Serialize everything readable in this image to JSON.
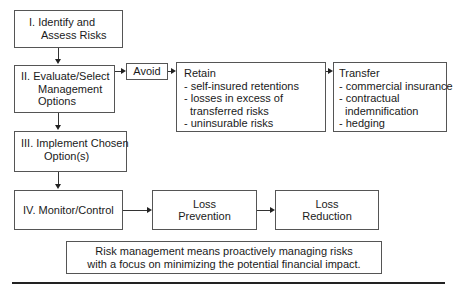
{
  "steps": [
    {
      "id": "identify",
      "lines": [
        "I.  Identify and",
        "Assess Risks"
      ]
    },
    {
      "id": "evaluate",
      "lines": [
        "II.  Evaluate/Select",
        "Management",
        "Options"
      ]
    },
    {
      "id": "implement",
      "lines": [
        "III.  Implement Chosen",
        "Option(s)"
      ]
    },
    {
      "id": "monitor",
      "lines": [
        "IV.  Monitor/Control"
      ]
    }
  ],
  "options": {
    "avoid": {
      "title": "Avoid"
    },
    "retain": {
      "title": "Retain",
      "items": [
        "- self-insured retentions",
        "- losses in excess of",
        "transferred risks",
        "- uninsurable risks"
      ]
    },
    "transfer": {
      "title": "Transfer",
      "items": [
        "- commercial insurance",
        "- contractual",
        "indemnification",
        "- hedging"
      ]
    }
  },
  "control": {
    "prevention": [
      "Loss",
      "Prevention"
    ],
    "reduction": [
      "Loss",
      "Reduction"
    ]
  },
  "summary": {
    "lines": [
      "Risk management means proactively managing risks",
      "with a focus on minimizing the potential financial impact."
    ]
  }
}
